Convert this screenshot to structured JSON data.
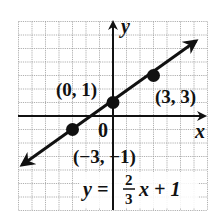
{
  "chart_data": {
    "type": "line",
    "title": "",
    "xlabel": "x",
    "ylabel": "y",
    "origin_label": "0",
    "xlim": [
      -7,
      7
    ],
    "ylim": [
      -7,
      7
    ],
    "grid": true,
    "equation": {
      "lhs": "y =",
      "numerator": "2",
      "denominator": "3",
      "rhs": "x + 1",
      "slope": 0.6667,
      "intercept": 1
    },
    "series": [
      {
        "name": "y = 2/3 x + 1",
        "x": [
          -3,
          0,
          3
        ],
        "y": [
          -1,
          1,
          3
        ]
      }
    ],
    "points": [
      {
        "x": -3,
        "y": -1,
        "label": "(−3, −1)"
      },
      {
        "x": 0,
        "y": 1,
        "label": "(0, 1)"
      },
      {
        "x": 3,
        "y": 3,
        "label": "(3, 3)"
      }
    ]
  },
  "colors": {
    "grid": "#9a9a9a",
    "axis": "#111111",
    "line": "#111111",
    "background": "#ffffff"
  }
}
